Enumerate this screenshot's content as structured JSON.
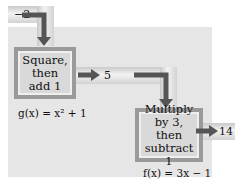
{
  "diagram": {
    "input": {
      "value": "−2"
    },
    "box_g": {
      "lines": [
        "Square,",
        "then",
        "add 1"
      ],
      "formula": "g(x) = x² + 1"
    },
    "intermediate": {
      "value": "5"
    },
    "box_f": {
      "lines": [
        "Multiply",
        "by 3, then",
        "subtract 1"
      ],
      "formula": "f(x) = 3x − 1"
    },
    "output": {
      "value": "14"
    },
    "colors": {
      "panel": "#e6e6e6",
      "box_border": "#9a9a9a",
      "box_fill": "#d9d9d9",
      "arrow": "#555555",
      "pipe": "#e0e0e0"
    }
  }
}
